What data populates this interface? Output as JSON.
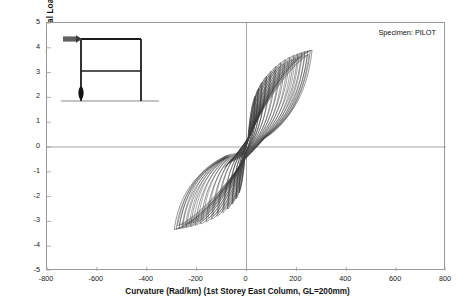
{
  "chart_data": {
    "type": "line",
    "title": "",
    "annotation": "Specimen: PILOT",
    "xlabel": "Curvature (Rad/km)  (1st Storey East Column, GL=200mm)",
    "ylabel": "Moment (Including Axial Load Effect)  (kN.m)",
    "xlim": [
      -800,
      800
    ],
    "ylim": [
      -5,
      5
    ],
    "xticks": [
      -800,
      -600,
      -400,
      -200,
      0,
      200,
      400,
      600,
      800
    ],
    "yticks": [
      5,
      4,
      3,
      2,
      1,
      0,
      -1,
      -2,
      -3,
      -4,
      -5
    ],
    "xtick_labels": [
      "-800",
      "-600",
      "-400",
      "-200",
      "0",
      "200",
      "400",
      "600",
      "800"
    ],
    "ytick_labels": [
      "5",
      "4",
      "3",
      "2",
      "1",
      "0",
      "-1",
      "-2",
      "-3",
      "-4",
      "-5"
    ],
    "grid": false,
    "legend": null,
    "zero_axis_lines": true,
    "line_color": "#303030",
    "series_name": "Moment-Curvature Hysteresis",
    "loops": [
      {
        "cycle": 1,
        "peak_curvature_pos": 35,
        "peak_moment_pos": 2.05,
        "peak_curvature_neg": -30,
        "peak_moment_neg": -1.85
      },
      {
        "cycle": 2,
        "peak_curvature_pos": 48,
        "peak_moment_pos": 2.35,
        "peak_curvature_neg": -42,
        "peak_moment_neg": -2.1
      },
      {
        "cycle": 3,
        "peak_curvature_pos": 62,
        "peak_moment_pos": 2.6,
        "peak_curvature_neg": -58,
        "peak_moment_neg": -2.3
      },
      {
        "cycle": 4,
        "peak_curvature_pos": 80,
        "peak_moment_pos": 2.85,
        "peak_curvature_neg": -76,
        "peak_moment_neg": -2.5
      },
      {
        "cycle": 5,
        "peak_curvature_pos": 98,
        "peak_moment_pos": 3.05,
        "peak_curvature_neg": -95,
        "peak_moment_neg": -2.65
      },
      {
        "cycle": 6,
        "peak_curvature_pos": 118,
        "peak_moment_pos": 3.25,
        "peak_curvature_neg": -118,
        "peak_moment_neg": -2.8
      },
      {
        "cycle": 7,
        "peak_curvature_pos": 137,
        "peak_moment_pos": 3.4,
        "peak_curvature_neg": -140,
        "peak_moment_neg": -2.92
      },
      {
        "cycle": 8,
        "peak_curvature_pos": 155,
        "peak_moment_pos": 3.52,
        "peak_curvature_neg": -162,
        "peak_moment_neg": -3.02
      },
      {
        "cycle": 9,
        "peak_curvature_pos": 173,
        "peak_moment_pos": 3.62,
        "peak_curvature_neg": -184,
        "peak_moment_neg": -3.1
      },
      {
        "cycle": 10,
        "peak_curvature_pos": 190,
        "peak_moment_pos": 3.7,
        "peak_curvature_neg": -205,
        "peak_moment_neg": -3.16
      },
      {
        "cycle": 11,
        "peak_curvature_pos": 206,
        "peak_moment_pos": 3.76,
        "peak_curvature_neg": -224,
        "peak_moment_neg": -3.21
      },
      {
        "cycle": 12,
        "peak_curvature_pos": 221,
        "peak_moment_pos": 3.81,
        "peak_curvature_neg": -241,
        "peak_moment_neg": -3.25
      },
      {
        "cycle": 13,
        "peak_curvature_pos": 234,
        "peak_moment_pos": 3.85,
        "peak_curvature_neg": -257,
        "peak_moment_neg": -3.28
      },
      {
        "cycle": 14,
        "peak_curvature_pos": 246,
        "peak_moment_pos": 3.88,
        "peak_curvature_neg": -271,
        "peak_moment_neg": -3.3
      },
      {
        "cycle": 15,
        "peak_curvature_pos": 256,
        "peak_moment_pos": 3.9,
        "peak_curvature_neg": -282,
        "peak_moment_neg": -3.32
      },
      {
        "cycle": 16,
        "peak_curvature_pos": 263,
        "peak_moment_pos": 3.91,
        "peak_curvature_neg": -290,
        "peak_moment_neg": -3.33
      }
    ]
  },
  "inset": {
    "name": "two-storey-portal-frame",
    "load_arrow": "lateral-load-arrow",
    "hinge_marker": "plastic-hinge-base-east-column"
  }
}
